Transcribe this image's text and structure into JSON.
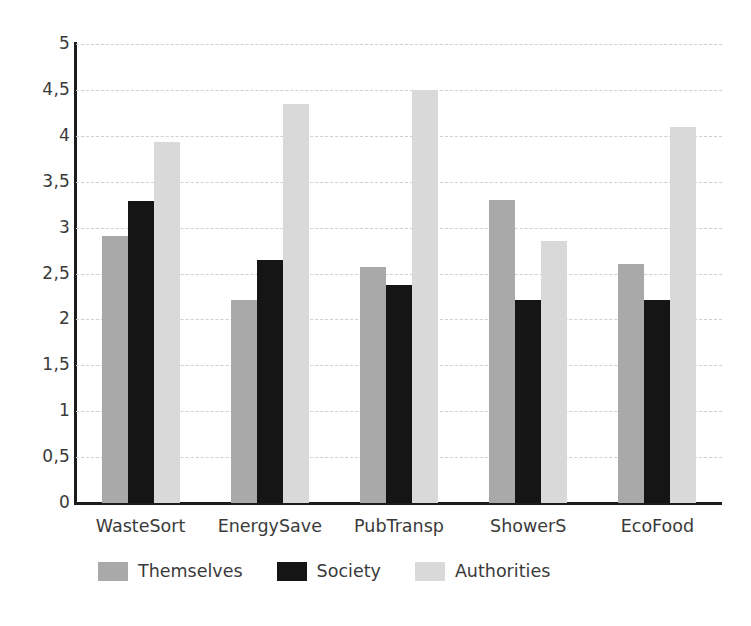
{
  "chart_data": {
    "type": "bar",
    "title": "",
    "subtitle": "",
    "xlabel": "",
    "ylabel": "",
    "categories": [
      "WasteSort",
      "EnergySave",
      "PubTransp",
      "ShowerS",
      "EcoFood"
    ],
    "series": [
      {
        "name": "Themselves",
        "color": "#a9a9a9",
        "values": [
          2.91,
          2.21,
          2.57,
          3.3,
          2.6
        ]
      },
      {
        "name": "Society",
        "color": "#151515",
        "values": [
          3.29,
          2.65,
          2.37,
          2.21,
          2.21
        ]
      },
      {
        "name": "Authorities",
        "color": "#d9d9d9",
        "values": [
          3.93,
          4.35,
          4.5,
          2.85,
          4.1
        ]
      }
    ],
    "ylim": [
      0,
      5
    ],
    "ytick_values": [
      0,
      0.5,
      1,
      1.5,
      2,
      2.5,
      3,
      3.5,
      4,
      4.5,
      5
    ],
    "ytick_labels": [
      "0",
      "0,5",
      "1",
      "1,5",
      "2",
      "2,5",
      "3",
      "3,5",
      "4",
      "4,5",
      "5"
    ],
    "grid": true,
    "grid_axis": "y",
    "grid_style": "dashed",
    "grid_color": "#cfcfcf",
    "legend_position": "bottom",
    "axis_color": "#1c1c1c",
    "text_color": "#3a3a3a",
    "background": "#ffffff",
    "decimal_separator": ","
  }
}
